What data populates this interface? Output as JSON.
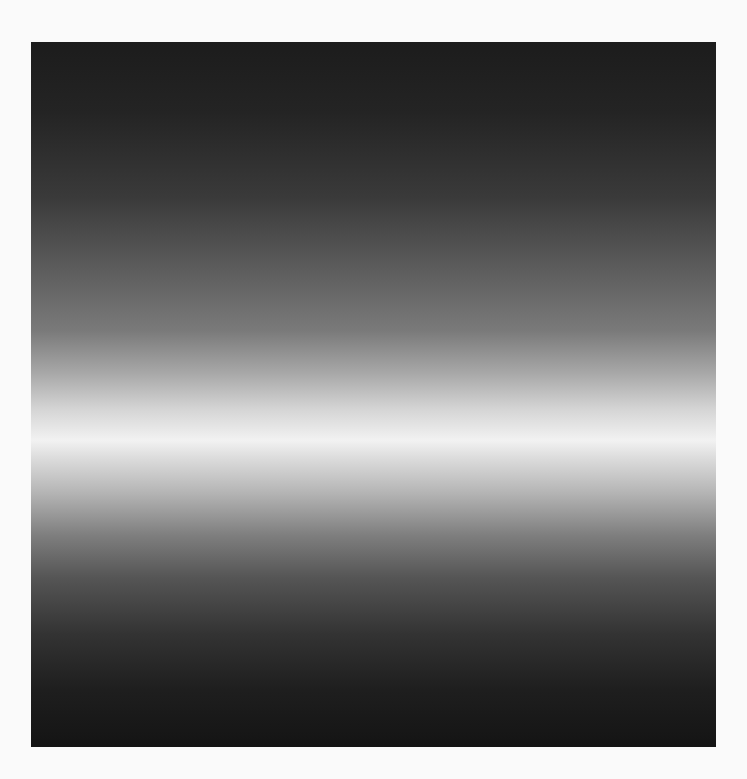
{
  "image": {
    "description": "Rectangular panel with vertical grayscale gradient: dark at top, bright white horizontal band slightly below center, dark at bottom",
    "panel": {
      "x": 31,
      "y": 42,
      "width": 685,
      "height": 705
    },
    "colors": {
      "background": "#fafafa",
      "top": "#1c1c1c",
      "peak": "#f2f2f2",
      "bottom": "#141414"
    },
    "highlight_band_y": 440
  }
}
